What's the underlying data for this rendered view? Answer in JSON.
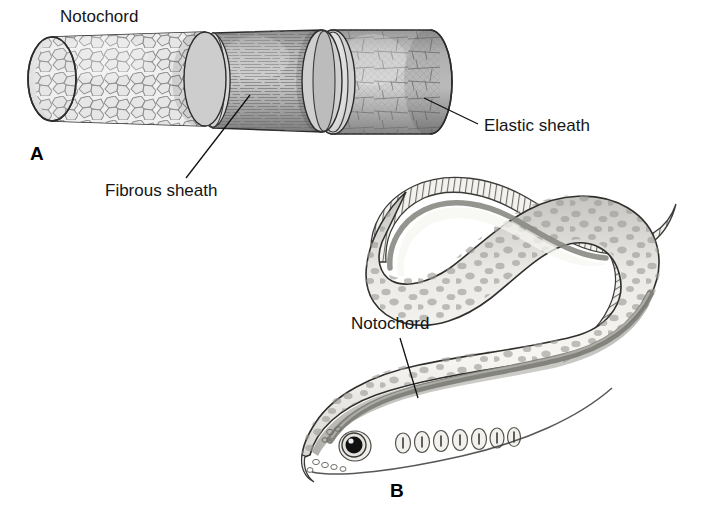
{
  "figure": {
    "width": 711,
    "height": 520,
    "background": "#ffffff",
    "type": "scientific-illustration"
  },
  "panels": [
    {
      "id": "A",
      "letter": "A",
      "letter_x": 30,
      "letter_y": 160,
      "subject": "notochord-cylinder-cutaway",
      "description": "Cylindrical notochord shown with three successive layers peeled back",
      "segments": [
        {
          "name": "notochord-core",
          "label": "Notochord",
          "texture": "polygonal vacuolated cells",
          "fill": "#e9e9e9"
        },
        {
          "name": "fibrous-sheath",
          "label": "Fibrous sheath",
          "texture": "longitudinal fibers",
          "fill": "#a8a8a8"
        },
        {
          "name": "elastic-sheath",
          "label": "Elastic sheath",
          "texture": "crosshatched fiber bands",
          "fill": "#b5b5b5"
        }
      ]
    },
    {
      "id": "B",
      "letter": "B",
      "letter_x": 390,
      "letter_y": 497,
      "subject": "lamprey-whole-body",
      "description": "Lateral view of a curved lamprey with notochord visible through the body",
      "features": {
        "gill_slit_count": 7,
        "body_fill": "#f0efec",
        "dorsal_fill": "#b9b8b4",
        "notochord_band_fill": "#8e8d88",
        "spot_fill": "#9b9a95",
        "fin_hatching": "vertical fin rays",
        "eye": "black pupil with white highlight and concentric rings"
      }
    }
  ],
  "labels": [
    {
      "id": "notochord-a",
      "text": "Notochord",
      "x": 60,
      "y": 22,
      "anchor": "start",
      "panel": "A",
      "has_leader": false
    },
    {
      "id": "fibrous-sheath",
      "text": "Fibrous sheath",
      "x": 105,
      "y": 196,
      "anchor": "start",
      "panel": "A",
      "has_leader": true,
      "leader": {
        "x1": 186,
        "y1": 178,
        "x2": 250,
        "y2": 95
      }
    },
    {
      "id": "elastic-sheath",
      "text": "Elastic sheath",
      "x": 484,
      "y": 131,
      "anchor": "start",
      "panel": "A",
      "has_leader": true,
      "leader": {
        "x1": 478,
        "y1": 124,
        "x2": 424,
        "y2": 98
      }
    },
    {
      "id": "notochord-b",
      "text": "Notochord",
      "x": 351,
      "y": 329,
      "anchor": "start",
      "panel": "B",
      "has_leader": true,
      "leader": {
        "x1": 400,
        "y1": 338,
        "x2": 418,
        "y2": 398
      }
    }
  ],
  "colors": {
    "background": "#ffffff",
    "ink": "#151515",
    "outline": "#2c2c2c",
    "light_gray": "#e9e9e9",
    "mid_gray": "#b5b5b5",
    "dark_gray": "#8e8d88"
  }
}
